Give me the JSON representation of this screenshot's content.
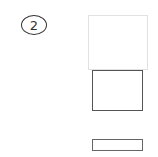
{
  "diagram": {
    "step_label": "2",
    "shapes": [
      {
        "name": "top-rectangle",
        "style": "light-outline"
      },
      {
        "name": "middle-rectangle",
        "style": "dark-outline"
      },
      {
        "name": "bottom-rectangle",
        "style": "dark-outline-thin"
      }
    ]
  },
  "colors": {
    "background": "#ffffff",
    "stroke_dark": "#555555",
    "stroke_light": "#e2e2e2"
  }
}
